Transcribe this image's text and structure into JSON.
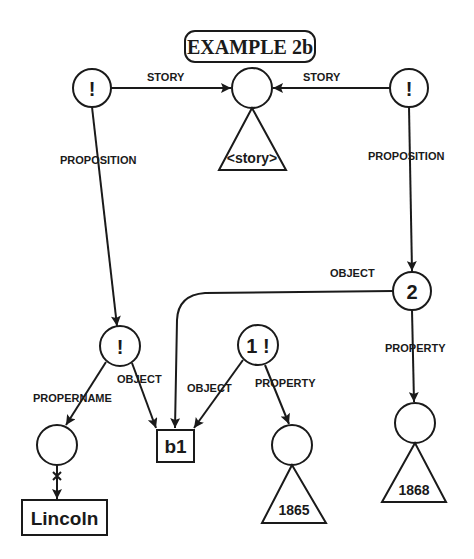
{
  "title": "EXAMPLE 2b",
  "nodes": {
    "top_left": "!",
    "top_center": "",
    "top_right": "!",
    "prop_two": "2",
    "mid_left": "!",
    "one_bang": "1 !",
    "b1": "b1",
    "name_node": "",
    "lincoln": "Lincoln",
    "year_node_1865": "",
    "year_node_1868": ""
  },
  "triangles": {
    "story": "<story>",
    "y1865": "1865",
    "y1868": "1868"
  },
  "edge_labels": {
    "story_left": "STORY",
    "story_right": "STORY",
    "proposition_left": "PROPOSITION",
    "proposition_right": "PROPOSITION",
    "object_two": "OBJECT",
    "property_two": "PROPERTY",
    "propername": "PROPERNAME",
    "object_left": "OBJECT",
    "object_one": "OBJECT",
    "property_one": "PROPERTY"
  },
  "colors": {
    "ink": "#1a1a1a",
    "background": "#ffffff"
  }
}
